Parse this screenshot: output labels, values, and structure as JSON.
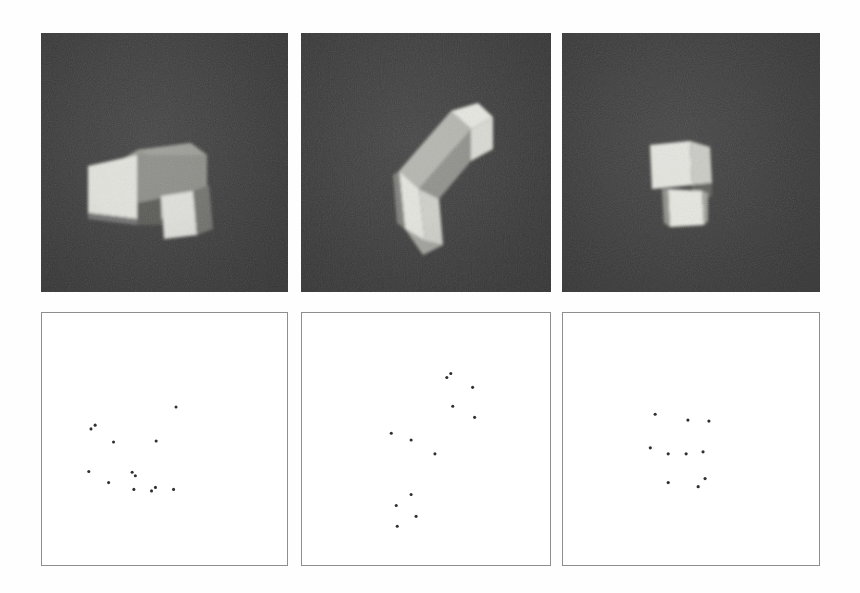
{
  "figure": {
    "name": "object-renderings-and-feature-points",
    "background_color": "#ffffff",
    "render_background_color": "#3a3a3a",
    "object_face_colors": {
      "bright": "#e8e8e2",
      "mid": "#b9b9b3",
      "dark": "#8d8d88",
      "shadow": "#6d6d69"
    },
    "point_color": "#303030",
    "point_box_border_color": "#8e8e8e",
    "columns": 3,
    "rows": 2
  },
  "render_panels": [
    {
      "label": "render-view-1",
      "caption": "",
      "x": 41,
      "y": 33,
      "w": 247,
      "h": 259,
      "view": "frontal L-block, notch at lower centre"
    },
    {
      "label": "render-view-2",
      "caption": "",
      "x": 301,
      "y": 33,
      "w": 250,
      "h": 259,
      "view": "rotated L-block, arm pointing upper-right"
    },
    {
      "label": "render-view-3",
      "caption": "",
      "x": 562,
      "y": 33,
      "w": 258,
      "h": 259,
      "view": "foreshortened L-block, near head-on"
    }
  ],
  "point_panels": [
    {
      "label": "feature-points-1",
      "x": 41,
      "y": 312,
      "w": 247,
      "h": 254,
      "point_count": 13,
      "points": [
        {
          "x": 0.2,
          "y": 0.46
        },
        {
          "x": 0.217,
          "y": 0.445
        },
        {
          "x": 0.292,
          "y": 0.512
        },
        {
          "x": 0.547,
          "y": 0.373
        },
        {
          "x": 0.466,
          "y": 0.508
        },
        {
          "x": 0.191,
          "y": 0.629
        },
        {
          "x": 0.272,
          "y": 0.673
        },
        {
          "x": 0.368,
          "y": 0.632
        },
        {
          "x": 0.381,
          "y": 0.646
        },
        {
          "x": 0.375,
          "y": 0.7
        },
        {
          "x": 0.447,
          "y": 0.706
        },
        {
          "x": 0.463,
          "y": 0.692
        },
        {
          "x": 0.537,
          "y": 0.7
        }
      ]
    },
    {
      "label": "feature-points-2",
      "x": 301,
      "y": 312,
      "w": 250,
      "h": 254,
      "point_count": 12,
      "points": [
        {
          "x": 0.584,
          "y": 0.256
        },
        {
          "x": 0.6,
          "y": 0.24
        },
        {
          "x": 0.688,
          "y": 0.295
        },
        {
          "x": 0.608,
          "y": 0.37
        },
        {
          "x": 0.696,
          "y": 0.414
        },
        {
          "x": 0.36,
          "y": 0.477
        },
        {
          "x": 0.44,
          "y": 0.504
        },
        {
          "x": 0.536,
          "y": 0.559
        },
        {
          "x": 0.44,
          "y": 0.72
        },
        {
          "x": 0.38,
          "y": 0.764
        },
        {
          "x": 0.46,
          "y": 0.807
        },
        {
          "x": 0.384,
          "y": 0.846
        }
      ]
    },
    {
      "label": "feature-points-3",
      "x": 562,
      "y": 312,
      "w": 258,
      "h": 254,
      "point_count": 10,
      "points": [
        {
          "x": 0.36,
          "y": 0.402
        },
        {
          "x": 0.488,
          "y": 0.425
        },
        {
          "x": 0.57,
          "y": 0.429
        },
        {
          "x": 0.341,
          "y": 0.535
        },
        {
          "x": 0.411,
          "y": 0.559
        },
        {
          "x": 0.481,
          "y": 0.559
        },
        {
          "x": 0.547,
          "y": 0.551
        },
        {
          "x": 0.411,
          "y": 0.673
        },
        {
          "x": 0.528,
          "y": 0.689
        },
        {
          "x": 0.555,
          "y": 0.657
        }
      ]
    }
  ]
}
